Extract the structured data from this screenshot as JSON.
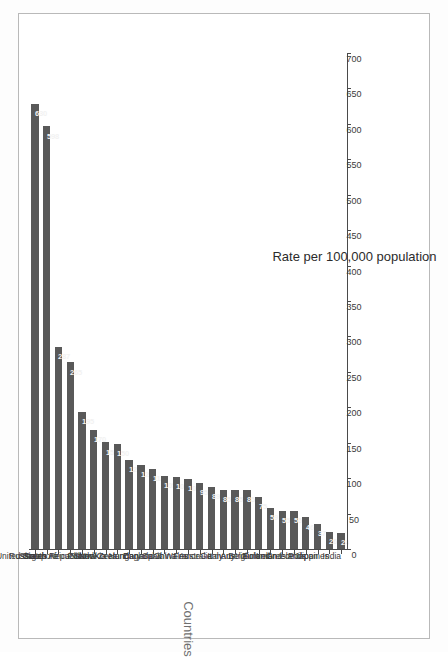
{
  "chart_data": {
    "type": "bar",
    "orientation": "vertical",
    "title": "",
    "xlabel": "Countries",
    "ylabel": "Rate per 100,000 population",
    "ylim": [
      0,
      700
    ],
    "yticks": [
      0,
      50,
      100,
      150,
      200,
      250,
      300,
      350,
      400,
      450,
      500,
      550,
      600,
      650,
      700
    ],
    "grid": false,
    "legend": false,
    "bar_color": "#595959",
    "value_label_color": "#f2f2f2",
    "categories": [
      "Russia",
      "United States",
      "Singapore",
      "South Africa",
      "Czech Republic",
      "Poland",
      "Slovakia",
      "South Korea",
      "New Zealand",
      "Hungary",
      "Canada",
      "Spain",
      "China",
      "England & Wales",
      "France",
      "Australia",
      "Italy",
      "Germany",
      "Austria",
      "Belgium",
      "Finland",
      "Ireland",
      "Greece",
      "Solomon Islands",
      "Japan",
      "Philippines",
      "India"
    ],
    "values": [
      630,
      598,
      287,
      265,
      195,
      170,
      152,
      150,
      127,
      120,
      115,
      105,
      103,
      100,
      95,
      89,
      85,
      85,
      85,
      75,
      59,
      55,
      55,
      46,
      37,
      26,
      24
    ]
  }
}
